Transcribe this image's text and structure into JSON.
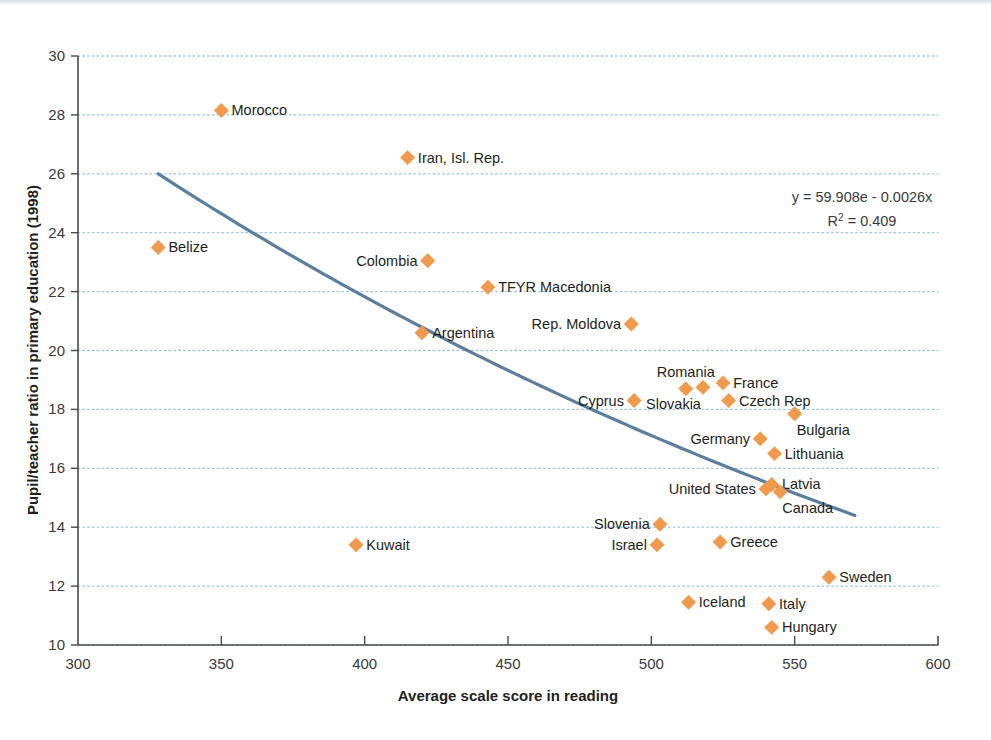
{
  "chart_data": {
    "type": "scatter",
    "title": "",
    "xlabel": "Average scale score in reading",
    "ylabel": "Pupil/teacher ratio in primary education (1998)",
    "xlim": [
      300,
      600
    ],
    "ylim": [
      10,
      30
    ],
    "xticks": [
      300,
      350,
      400,
      450,
      500,
      550,
      600
    ],
    "yticks": [
      10,
      12,
      14,
      16,
      18,
      20,
      22,
      24,
      26,
      28,
      30
    ],
    "grid": "horizontal-dotted",
    "legend": "none",
    "marker": "diamond",
    "marker_color": "#F09A4E",
    "trendline_color": "#5B7E9E",
    "points": [
      {
        "label": "Morocco",
        "x": 350,
        "y": 28.15,
        "label_side": "right"
      },
      {
        "label": "Belize",
        "x": 328,
        "y": 23.5,
        "label_side": "right"
      },
      {
        "label": "Iran, Isl. Rep.",
        "x": 415,
        "y": 26.55,
        "label_side": "right"
      },
      {
        "label": "Colombia",
        "x": 422,
        "y": 23.05,
        "label_side": "left"
      },
      {
        "label": "TFYR Macedonia",
        "x": 443,
        "y": 22.15,
        "label_side": "right"
      },
      {
        "label": "Argentina",
        "x": 420,
        "y": 20.6,
        "label_side": "right"
      },
      {
        "label": "Rep. Moldova",
        "x": 493,
        "y": 20.9,
        "label_side": "left"
      },
      {
        "label": "Kuwait",
        "x": 397,
        "y": 13.4,
        "label_side": "right"
      },
      {
        "label": "Cyprus",
        "x": 494,
        "y": 18.3,
        "label_side": "left"
      },
      {
        "label": "Romania",
        "x": 512,
        "y": 18.7,
        "label_side": "above"
      },
      {
        "label": "Slovakia",
        "x": 518,
        "y": 18.75,
        "label_side": "below-left"
      },
      {
        "label": "France",
        "x": 525,
        "y": 18.9,
        "label_side": "right"
      },
      {
        "label": "Czech Rep",
        "x": 527,
        "y": 18.3,
        "label_side": "right"
      },
      {
        "label": "Bulgaria",
        "x": 550,
        "y": 17.85,
        "label_side": "below-right"
      },
      {
        "label": "Germany",
        "x": 538,
        "y": 17.0,
        "label_side": "left"
      },
      {
        "label": "Lithuania",
        "x": 543,
        "y": 16.5,
        "label_side": "right"
      },
      {
        "label": "Latvia",
        "x": 542,
        "y": 15.45,
        "label_side": "right"
      },
      {
        "label": "United States",
        "x": 540,
        "y": 15.3,
        "label_side": "left"
      },
      {
        "label": "Canada",
        "x": 545,
        "y": 15.2,
        "label_side": "below-right"
      },
      {
        "label": "Slovenia",
        "x": 503,
        "y": 14.1,
        "label_side": "left"
      },
      {
        "label": "Israel",
        "x": 502,
        "y": 13.4,
        "label_side": "left"
      },
      {
        "label": "Greece",
        "x": 524,
        "y": 13.5,
        "label_side": "right"
      },
      {
        "label": "Sweden",
        "x": 562,
        "y": 12.3,
        "label_side": "right"
      },
      {
        "label": "Iceland",
        "x": 513,
        "y": 11.45,
        "label_side": "right"
      },
      {
        "label": "Italy",
        "x": 541,
        "y": 11.4,
        "label_side": "right"
      },
      {
        "label": "Hungary",
        "x": 542,
        "y": 10.6,
        "label_side": "right"
      }
    ],
    "trendline": {
      "type": "exponential",
      "x_start": 328,
      "y_start": 26.0,
      "x_end": 571,
      "y_end": 14.4
    },
    "annotation": {
      "equation": "y = 59.908e - 0.0026x",
      "r_squared_prefix": "R",
      "r_squared_sup": "2",
      "r_squared_value": " = 0.409"
    }
  }
}
